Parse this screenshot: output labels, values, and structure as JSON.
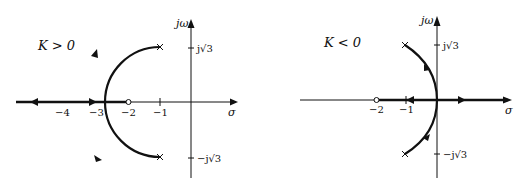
{
  "figure": {
    "type": "root-locus",
    "panels": [
      {
        "id": "k-positive",
        "title": "K > 0",
        "axes": {
          "x_label": "σ",
          "y_label": "jω",
          "x_ticks": [
            "−4",
            "−3",
            "−2",
            "−1"
          ],
          "y_ticks": [
            "j√3",
            "−j√3"
          ]
        },
        "poles": [
          "-1+j√3",
          "-1-j√3"
        ],
        "zeros": [
          "-2"
        ],
        "breakaway_point": "-4",
        "locus": "circular arc centered at -2 of radius √3 from poles to -4, then along real axis to -∞ and toward zero at -2"
      },
      {
        "id": "k-negative",
        "title": "K < 0",
        "axes": {
          "x_label": "σ",
          "y_label": "jω",
          "x_ticks": [
            "−2",
            "−1"
          ],
          "y_ticks": [
            "j√3",
            "−j√3"
          ]
        },
        "poles": [
          "-1+j√3",
          "-1-j√3"
        ],
        "zeros": [
          "-2"
        ],
        "breakaway_point": "0",
        "locus": "arc from poles to origin, then along real axis to +∞ and toward zero at -2"
      }
    ]
  },
  "colors": {
    "ink": "#111111",
    "background": "#ffffff"
  }
}
